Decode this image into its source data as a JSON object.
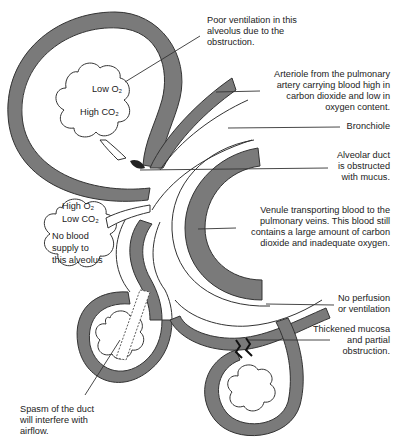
{
  "diagram": {
    "title": "",
    "alveolus_top_cloud": {
      "line1": "Low O₂",
      "line2": "High CO₂"
    },
    "alveolus_left_cloud": {
      "line1": "High O₂",
      "line2": "Low CO₂",
      "line3": "No blood",
      "line4": "supply to",
      "line5": "this alveolus"
    },
    "annotations": {
      "poor_ventilation": [
        "Poor ventilation in this",
        "alveolus due to the",
        "obstruction."
      ],
      "arteriole": [
        "Arteriole from the pulmonary",
        "artery carrying blood high in",
        "carbon dioxide and low in",
        "oxygen content."
      ],
      "bronchiole": [
        "Bronchiole"
      ],
      "alveolar_duct": [
        "Alveolar duct",
        "is obstructed",
        "with mucus."
      ],
      "venule": [
        "Venule transporting blood to the",
        "pulmonary veins. This blood still",
        "contains a large amount of carbon",
        "dioxide and inadequate oxygen."
      ],
      "no_perfusion": [
        "No perfusion",
        "or ventilation"
      ],
      "thickened_mucosa": [
        "Thickened mucosa",
        "and partial",
        "obstruction."
      ],
      "spasm": [
        "Spasm of the duct",
        "will interfere with",
        "airflow."
      ]
    },
    "colors": {
      "vessel_fill": "#7a7a7a",
      "outline": "#333333",
      "background": "#ffffff"
    }
  }
}
